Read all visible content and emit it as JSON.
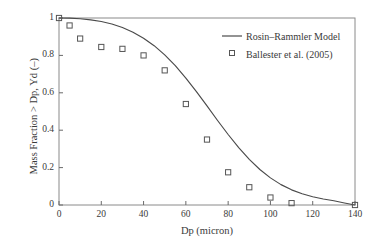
{
  "chart_data": {
    "type": "line",
    "title": "",
    "xlabel": "Dp (micron)",
    "ylabel": "Mass Fraction > Dp, Yd (–)",
    "xlim": [
      0,
      140
    ],
    "ylim": [
      0,
      1
    ],
    "xticks": [
      0,
      20,
      40,
      60,
      80,
      100,
      120,
      140
    ],
    "xticklabels": [
      "0",
      "20",
      "40",
      "60",
      "80",
      "100",
      "120",
      "140"
    ],
    "yticks": [
      0,
      0.2,
      0.4,
      0.6,
      0.8,
      1
    ],
    "yticklabels": [
      "0",
      "0.2",
      "0.4",
      "0.6",
      "0.8",
      "1"
    ],
    "grid": false,
    "legend_position": "upper right",
    "frame": "box",
    "series": [
      {
        "name": "Rosin–Rammler Model",
        "type": "line",
        "marker": "none",
        "color": "#4a4a4a",
        "x": [
          0,
          5,
          10,
          15,
          20,
          25,
          30,
          35,
          40,
          45,
          50,
          55,
          60,
          65,
          70,
          75,
          80,
          85,
          90,
          95,
          100,
          105,
          110,
          115,
          120,
          125,
          130,
          135,
          140
        ],
        "y": [
          1.0,
          0.999,
          0.996,
          0.99,
          0.981,
          0.968,
          0.949,
          0.924,
          0.892,
          0.852,
          0.803,
          0.745,
          0.679,
          0.606,
          0.53,
          0.452,
          0.377,
          0.307,
          0.244,
          0.19,
          0.145,
          0.109,
          0.081,
          0.06,
          0.044,
          0.032,
          0.023,
          0.011,
          0.0
        ]
      },
      {
        "name": "Ballester et al. (2005)",
        "type": "scatter",
        "marker": "open-square",
        "color": "#555555",
        "x": [
          0,
          5,
          10,
          20,
          30,
          40,
          50,
          60,
          70,
          80,
          90,
          100,
          110,
          140
        ],
        "y": [
          1.0,
          0.96,
          0.89,
          0.845,
          0.835,
          0.8,
          0.72,
          0.54,
          0.35,
          0.175,
          0.095,
          0.04,
          0.01,
          0.0
        ]
      }
    ]
  },
  "legend": {
    "items": [
      {
        "label": "Rosin–Rammler Model",
        "marker": "line"
      },
      {
        "label": "Ballester et al. (2005)",
        "marker": "open-square"
      }
    ]
  },
  "axes": {
    "x_title": "Dp (micron)",
    "y_title": "Mass Fraction > Dp, Yd (–)"
  }
}
